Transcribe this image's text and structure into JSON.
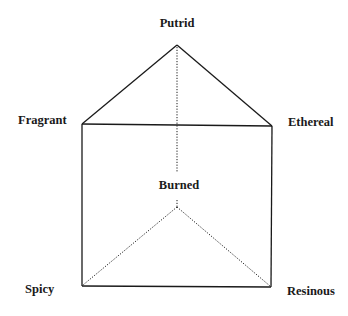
{
  "diagram": {
    "type": "odor-prism",
    "colors": {
      "line": "#1a1a1a",
      "background": "#ffffff"
    },
    "vertices": {
      "putrid": {
        "label": "Putrid",
        "x": 177,
        "y": 45
      },
      "fragrant": {
        "label": "Fragrant",
        "x": 82,
        "y": 124
      },
      "ethereal": {
        "label": "Ethereal",
        "x": 272,
        "y": 126
      },
      "burned": {
        "label": "Burned",
        "x": 177,
        "y": 207
      },
      "spicy": {
        "label": "Spicy",
        "x": 82,
        "y": 286
      },
      "resinous": {
        "label": "Resinous",
        "x": 271,
        "y": 287
      }
    },
    "edges": {
      "solid": [
        [
          "putrid",
          "fragrant"
        ],
        [
          "putrid",
          "ethereal"
        ],
        [
          "fragrant",
          "ethereal"
        ],
        [
          "fragrant",
          "spicy"
        ],
        [
          "ethereal",
          "resinous"
        ],
        [
          "spicy",
          "resinous"
        ]
      ],
      "dotted": [
        [
          "putrid",
          "burned"
        ],
        [
          "burned",
          "spicy"
        ],
        [
          "burned",
          "resinous"
        ]
      ]
    }
  }
}
